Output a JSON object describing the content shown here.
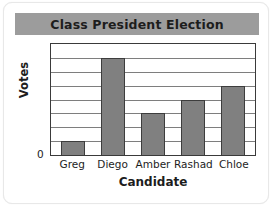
{
  "card": {
    "background": "#ffffff",
    "border_color": "#e8e8e8"
  },
  "title_banner": {
    "background": "#9c9c9c",
    "title": "Class President Election"
  },
  "axes": {
    "y_title": "Votes",
    "y_tick_zero": "0",
    "x_title": "Candidate"
  },
  "chart_data": {
    "type": "bar",
    "title": "Class President Election",
    "xlabel": "Candidate",
    "ylabel": "Votes",
    "categories": [
      "Greg",
      "Diego",
      "Amber",
      "Rashad",
      "Chloe"
    ],
    "values": [
      1,
      7,
      3,
      4,
      5
    ],
    "ylim": [
      0,
      8
    ],
    "y_tick_labels": [
      "0"
    ],
    "gridlines": 7,
    "grid": true,
    "legend": "none",
    "bar_fill_color": "#808080",
    "bar_edge_color": "#3d3d3d",
    "gridline_color": "#7e7e7e",
    "plot_border_color": "#3a3a3a"
  }
}
